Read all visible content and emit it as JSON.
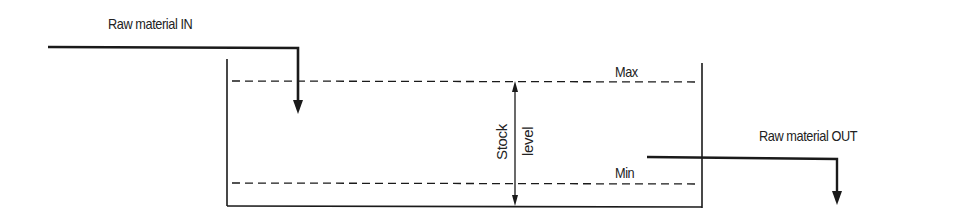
{
  "diagram": {
    "labels": {
      "in": "Raw material   IN",
      "out": "Raw material   OUT",
      "max": "Max",
      "min": "Min",
      "stock_line1": "Stock",
      "stock_line2": "level"
    },
    "colors": {
      "line": "#1a1a1a",
      "background": "#ffffff"
    },
    "elements": [
      {
        "type": "tank",
        "description": "open-top container holding raw material stock"
      },
      {
        "type": "arrow",
        "label": "Raw material IN",
        "direction": "down-into-tank"
      },
      {
        "type": "arrow",
        "label": "Raw material OUT",
        "direction": "out-of-tank-down"
      },
      {
        "type": "dashed-line",
        "label": "Max"
      },
      {
        "type": "dashed-line",
        "label": "Min"
      },
      {
        "type": "double-arrow",
        "label": "Stock level"
      }
    ]
  }
}
